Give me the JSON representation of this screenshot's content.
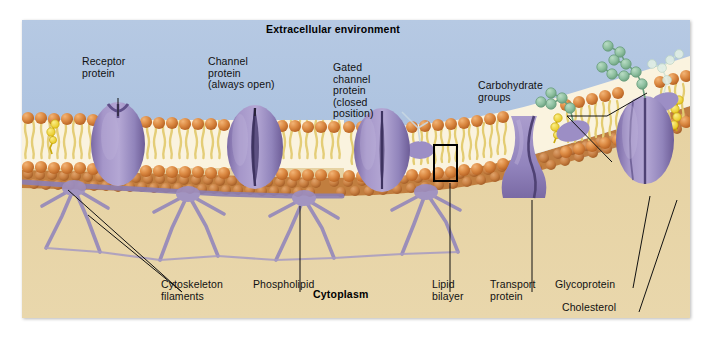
{
  "figure": {
    "title_top": "Extracellular environment",
    "title_bottom": "Cytoplasm"
  },
  "colors": {
    "extracellular": "#aec4e0",
    "cytoplasm": "#e7d3a4",
    "protein_purple": "#9b8cc0",
    "protein_purple_dark": "#6f5f9a",
    "phosphate_head": "#d2762f",
    "phosphate_head_light": "#e7a163",
    "tail_yellow": "#e8d37a",
    "carbohydrate_green": "#8fc2a0",
    "cholesterol_yellow": "#f2dc3c",
    "cytoskeleton_purple": "#8d7fb4",
    "leader_line": "#111111",
    "panel_border": "#b9b9b9"
  },
  "labels": [
    {
      "id": "receptor-protein",
      "text": "Receptor\nprotein",
      "x": 82,
      "y": 56,
      "align": "left"
    },
    {
      "id": "channel-protein",
      "text": "Channel\nprotein\n(always open)",
      "x": 208,
      "y": 56,
      "align": "left"
    },
    {
      "id": "gated-channel-protein",
      "text": "Gated\nchannel\nprotein\n(closed\nposition)",
      "x": 333,
      "y": 62,
      "align": "left"
    },
    {
      "id": "carbohydrate-groups",
      "text": "Carbohydrate\ngroups",
      "x": 478,
      "y": 80,
      "align": "left"
    },
    {
      "id": "cytoskeleton-filaments",
      "text": "Cytoskeleton\nfilaments",
      "x": 161,
      "y": 279,
      "align": "left"
    },
    {
      "id": "phospholipid",
      "text": "Phospholipid",
      "x": 253,
      "y": 279,
      "align": "left"
    },
    {
      "id": "lipid-bilayer",
      "text": "Lipid\nbilayer",
      "x": 432,
      "y": 279,
      "align": "left"
    },
    {
      "id": "transport-protein",
      "text": "Transport\nprotein",
      "x": 490,
      "y": 279,
      "align": "left"
    },
    {
      "id": "glycoprotein",
      "text": "Glycoprotein",
      "x": 555,
      "y": 279,
      "align": "left"
    },
    {
      "id": "cholesterol",
      "text": "Cholesterol",
      "x": 562,
      "y": 302,
      "align": "left"
    }
  ],
  "structures": {
    "membrane_proteins": [
      {
        "name": "receptor-protein",
        "kind": "receptor",
        "cx": 96,
        "notch": true
      },
      {
        "name": "channel-protein",
        "kind": "channel",
        "cx": 233,
        "open": true
      },
      {
        "name": "gated-channel-protein",
        "kind": "channel",
        "cx": 360,
        "open": false
      },
      {
        "name": "transport-protein",
        "kind": "transport",
        "cx": 512
      },
      {
        "name": "glycoprotein",
        "kind": "glyco",
        "cx": 623
      }
    ],
    "cholesterol_count": 5,
    "carbohydrate_chain_count": 3,
    "cytoskeleton_node_count": 4
  }
}
